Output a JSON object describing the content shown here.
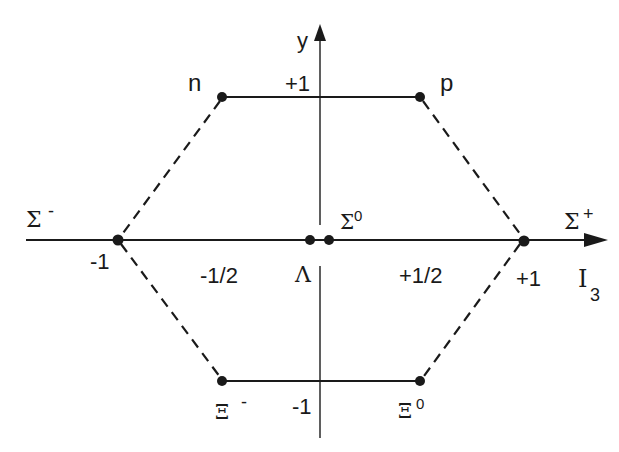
{
  "diagram": {
    "axes": {
      "x": {
        "label": "I",
        "label_sub": "3",
        "ticks": [
          "-1",
          "-1/2",
          "+1/2",
          "+1"
        ]
      },
      "y": {
        "label": "y",
        "ticks": [
          "+1",
          "-1"
        ]
      }
    },
    "particles": [
      {
        "id": "n",
        "label": "n",
        "sup": "",
        "I3": "-1/2",
        "y": "+1"
      },
      {
        "id": "p",
        "label": "p",
        "sup": "",
        "I3": "+1/2",
        "y": "+1"
      },
      {
        "id": "sigma_minus",
        "label": "Σ",
        "sup": "-",
        "I3": "-1",
        "y": "0"
      },
      {
        "id": "lambda",
        "label": "Λ",
        "sup": "",
        "I3": "0",
        "y": "0"
      },
      {
        "id": "sigma_zero",
        "label": "Σ",
        "sup": "0",
        "I3": "0",
        "y": "0"
      },
      {
        "id": "sigma_plus",
        "label": "Σ",
        "sup": "+",
        "I3": "+1",
        "y": "0"
      },
      {
        "id": "xi_minus",
        "label": "Ξ",
        "sup": "-",
        "I3": "-1/2",
        "y": "-1"
      },
      {
        "id": "xi_zero",
        "label": "Ξ",
        "sup": "0",
        "I3": "+1/2",
        "y": "-1"
      }
    ],
    "edges": {
      "solid": [
        [
          "n",
          "p"
        ],
        [
          "xi_minus",
          "xi_zero"
        ]
      ],
      "dashed": [
        [
          "n",
          "sigma_minus"
        ],
        [
          "sigma_minus",
          "xi_minus"
        ],
        [
          "p",
          "sigma_plus"
        ],
        [
          "sigma_plus",
          "xi_zero"
        ]
      ]
    },
    "colors": {
      "ink": "#1a1a1a",
      "background": "#ffffff"
    }
  }
}
